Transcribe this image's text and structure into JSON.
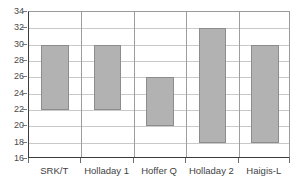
{
  "chart_data": {
    "type": "bar",
    "bar_style": "floating-range",
    "title": "",
    "subtitle": "",
    "xlabel": "",
    "ylabel": "",
    "categories": [
      "SRK/T",
      "Holladay 1",
      "Hoffer Q",
      "Holladay 2",
      "Haigis-L"
    ],
    "series": [
      {
        "name": "range",
        "low": [
          22,
          22,
          20,
          18,
          18
        ],
        "high": [
          30,
          30,
          26,
          32,
          30
        ]
      }
    ],
    "values": [
      30,
      30,
      26,
      32,
      30
    ],
    "ylim": [
      16,
      34
    ],
    "ytick_step": 2,
    "yticks": [
      34,
      32,
      30,
      28,
      26,
      24,
      22,
      20,
      18,
      16
    ],
    "ytick_labels": [
      "34",
      "32",
      "30",
      "28",
      "26",
      "24",
      "22",
      "20",
      "18",
      "16"
    ],
    "grid": {
      "horizontal": true,
      "vertical": true
    },
    "legend": {
      "visible": false,
      "position": "none",
      "entries": []
    },
    "annotations": [],
    "colors": {
      "bar_fill": "#b2b2b2",
      "bar_border": "#8c8c8c",
      "gridline": "#c9c9c9",
      "vertical_gridline": "#9d9d9d",
      "axis": "#3c3c3c",
      "tick_text": "#4a4a4a",
      "category_text": "#3f3f3f",
      "background": "#ffffff"
    }
  }
}
